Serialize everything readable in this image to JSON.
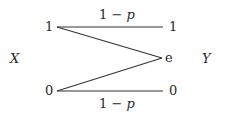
{
  "diagram": {
    "input_variable": "X",
    "output_variable": "Y",
    "inputs": [
      {
        "id": "in1",
        "label": "1"
      },
      {
        "id": "in0",
        "label": "0"
      }
    ],
    "outputs": [
      {
        "id": "out1",
        "label": "1"
      },
      {
        "id": "oute",
        "label": "e"
      },
      {
        "id": "out0",
        "label": "0"
      }
    ],
    "edges": [
      {
        "from": "in1",
        "to": "out1",
        "label": "1 − p"
      },
      {
        "from": "in1",
        "to": "oute",
        "label": ""
      },
      {
        "from": "in0",
        "to": "oute",
        "label": ""
      },
      {
        "from": "in0",
        "to": "out0",
        "label": "1 − p"
      }
    ],
    "top_edge_label_num": "1 − ",
    "top_edge_label_var": "p",
    "bottom_edge_label_num": "1 − ",
    "bottom_edge_label_var": "p"
  }
}
